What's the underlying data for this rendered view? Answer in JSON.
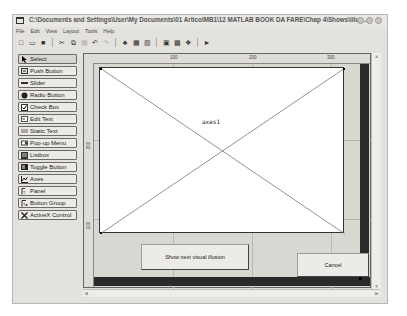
{
  "window": {
    "title": "C:\\Documents and Settings\\User\\My Documents\\01 ArticolMB1\\12 MATLAB BOOK DA FARE\\Chap 4\\Shows\\illus...",
    "controls": [
      "minimize",
      "maximize",
      "close"
    ]
  },
  "menu": {
    "items": [
      {
        "label": "File"
      },
      {
        "label": "Edit"
      },
      {
        "label": "View"
      },
      {
        "label": "Layout"
      },
      {
        "label": "Tools"
      },
      {
        "label": "Help"
      }
    ]
  },
  "toolbar": {
    "buttons": [
      {
        "name": "new-icon",
        "glyph": "□"
      },
      {
        "name": "open-icon",
        "glyph": "▭"
      },
      {
        "name": "save-icon",
        "glyph": "■"
      },
      {
        "name": "cut-icon",
        "glyph": "✂"
      },
      {
        "name": "copy-icon",
        "glyph": "⧉"
      },
      {
        "name": "paste-icon",
        "glyph": "▤"
      },
      {
        "name": "undo-icon",
        "glyph": "↶"
      },
      {
        "name": "redo-icon",
        "glyph": "↷"
      },
      {
        "name": "align-objects-icon",
        "glyph": "♣"
      },
      {
        "name": "menu-editor-icon",
        "glyph": "▦"
      },
      {
        "name": "tab-order-editor-icon",
        "glyph": "▥"
      },
      {
        "name": "m-file-editor-icon",
        "glyph": "▣"
      },
      {
        "name": "property-inspector-icon",
        "glyph": "▩"
      },
      {
        "name": "object-browser-icon",
        "glyph": "❖"
      },
      {
        "name": "run-icon",
        "glyph": "►"
      }
    ]
  },
  "palette": {
    "items": [
      {
        "label": "Select",
        "icon": "arrow-icon",
        "selected": true
      },
      {
        "label": "Push Button",
        "icon": "push-button-icon"
      },
      {
        "label": "Slider",
        "icon": "slider-icon"
      },
      {
        "label": "Radio Button",
        "icon": "radio-button-icon"
      },
      {
        "label": "Check Box",
        "icon": "check-box-icon"
      },
      {
        "label": "Edit Text",
        "icon": "edit-text-icon"
      },
      {
        "label": "Static Text",
        "icon": "static-text-icon"
      },
      {
        "label": "Pop-up Menu",
        "icon": "popup-menu-icon"
      },
      {
        "label": "Listbox",
        "icon": "listbox-icon"
      },
      {
        "label": "Toggle Button",
        "icon": "toggle-button-icon"
      },
      {
        "label": "Axes",
        "icon": "axes-icon"
      },
      {
        "label": "Panel",
        "icon": "panel-icon"
      },
      {
        "label": "Button Group",
        "icon": "button-group-icon"
      },
      {
        "label": "ActiveX Control",
        "icon": "activex-icon"
      }
    ]
  },
  "rulers": {
    "top_ticks": [
      "100",
      "200",
      "300"
    ],
    "left_ticks": [
      "200",
      "100"
    ]
  },
  "figure": {
    "axes_tag": "axes1",
    "push_button_label": "Show next visual illusion",
    "cancel_button_label": "Cancel"
  },
  "colors": {
    "window_bg": "#e4e2dc",
    "canvas_bg": "#d9d7d2",
    "axes_bg": "#ffffff",
    "figure_border": "#2a2a2a"
  }
}
